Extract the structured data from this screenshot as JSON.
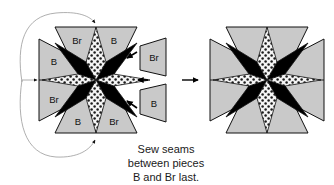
{
  "figure": {
    "name": "quilt-block-assembly-diagram",
    "caption": {
      "line1": "Sew seams",
      "line2": "between pieces",
      "line3": "B and Br last."
    },
    "colors": {
      "background": "#ffffff",
      "outline": "#111111",
      "piece_gray": "#c9c9c9",
      "star_black": "#000000",
      "star_dotted_base": "#f2f2f2",
      "star_dot": "#111111",
      "guide_line": "#9a9a9a",
      "arrow": "#000000"
    }
  },
  "left_diagram": {
    "name": "in-progress-block",
    "star": {
      "points": [
        {
          "position": "north",
          "fill": "dotted"
        },
        {
          "position": "northeast",
          "fill": "black"
        },
        {
          "position": "east",
          "fill": "dotted"
        },
        {
          "position": "southeast",
          "fill": "black"
        },
        {
          "position": "south",
          "fill": "dotted"
        },
        {
          "position": "southwest",
          "fill": "black"
        },
        {
          "position": "west",
          "fill": "dotted"
        },
        {
          "position": "northwest",
          "fill": "black"
        }
      ]
    },
    "attached_pieces": [
      {
        "slot": "top",
        "labels": [
          "Br",
          "B"
        ]
      },
      {
        "slot": "left",
        "labels": [
          "B",
          "Br"
        ]
      },
      {
        "slot": "bottom",
        "labels": [
          "B",
          "Br"
        ]
      }
    ],
    "detached_pieces": [
      {
        "slot": "right-upper",
        "label": "Br"
      },
      {
        "slot": "right-lower",
        "label": "B"
      }
    ],
    "guides": [
      {
        "name": "top-wrap-guide",
        "style": "thin-curve",
        "arrow": "down"
      },
      {
        "name": "left-straight-guide",
        "style": "thin-straight",
        "arrow": "right"
      },
      {
        "name": "bottom-wrap-guide",
        "style": "thin-curve",
        "arrow": "up"
      },
      {
        "name": "detach-upper-arrow",
        "style": "bold",
        "arrow": "left"
      },
      {
        "name": "detach-lower-arrow",
        "style": "bold",
        "arrow": "left"
      }
    ]
  },
  "transition": {
    "name": "progress-arrow",
    "direction": "right"
  },
  "right_diagram": {
    "name": "completed-block",
    "star": {
      "points": [
        {
          "position": "north",
          "fill": "dotted"
        },
        {
          "position": "northeast",
          "fill": "black"
        },
        {
          "position": "east",
          "fill": "dotted"
        },
        {
          "position": "southeast",
          "fill": "black"
        },
        {
          "position": "south",
          "fill": "dotted"
        },
        {
          "position": "southwest",
          "fill": "black"
        },
        {
          "position": "west",
          "fill": "dotted"
        },
        {
          "position": "northwest",
          "fill": "black"
        }
      ]
    },
    "pieces": [
      {
        "slot": "top-left",
        "label": ""
      },
      {
        "slot": "top-right",
        "label": ""
      },
      {
        "slot": "left-top",
        "label": ""
      },
      {
        "slot": "left-bottom",
        "label": ""
      },
      {
        "slot": "right-top",
        "label": ""
      },
      {
        "slot": "right-bottom",
        "label": ""
      },
      {
        "slot": "bottom-left",
        "label": ""
      },
      {
        "slot": "bottom-right",
        "label": ""
      }
    ]
  }
}
